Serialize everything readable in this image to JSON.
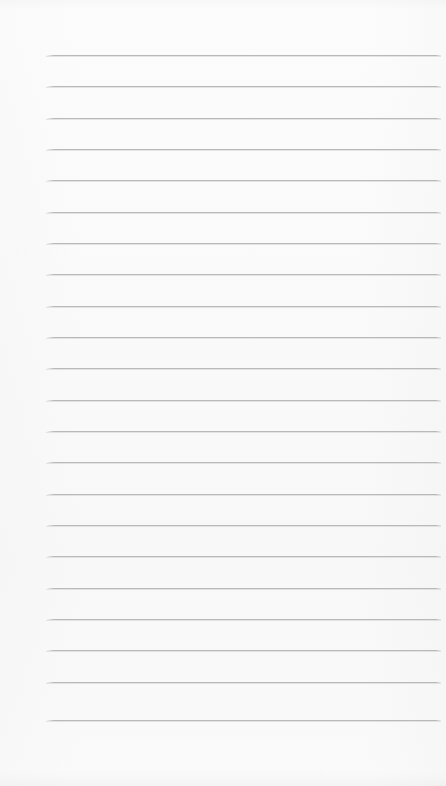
{
  "document": {
    "kind": "lined-paper",
    "title": "",
    "text_content": "",
    "page_width": 446,
    "page_height": 786,
    "background_color": "#fcfcfc"
  },
  "ruling": {
    "line_color": "#b9b9b9",
    "line_thickness": 1,
    "line_count": 22,
    "line_spacing": 31.3,
    "first_line_y": 55,
    "last_line_y": 720,
    "line_left_x": 46,
    "line_right_x": 441,
    "lines": [
      {
        "index": 1,
        "y": 55
      },
      {
        "index": 2,
        "y": 86
      },
      {
        "index": 3,
        "y": 118
      },
      {
        "index": 4,
        "y": 149
      },
      {
        "index": 5,
        "y": 180
      },
      {
        "index": 6,
        "y": 212
      },
      {
        "index": 7,
        "y": 243
      },
      {
        "index": 8,
        "y": 274
      },
      {
        "index": 9,
        "y": 306
      },
      {
        "index": 10,
        "y": 337
      },
      {
        "index": 11,
        "y": 368
      },
      {
        "index": 12,
        "y": 400
      },
      {
        "index": 13,
        "y": 431
      },
      {
        "index": 14,
        "y": 462
      },
      {
        "index": 15,
        "y": 494
      },
      {
        "index": 16,
        "y": 525
      },
      {
        "index": 17,
        "y": 556
      },
      {
        "index": 18,
        "y": 588
      },
      {
        "index": 19,
        "y": 619
      },
      {
        "index": 20,
        "y": 650
      },
      {
        "index": 21,
        "y": 682
      },
      {
        "index": 22,
        "y": 720
      }
    ]
  },
  "margins": {
    "top_blank_height": 55,
    "bottom_blank_height": 66,
    "left_margin_width": 46,
    "right_margin_width": 5,
    "has_vertical_margin_rule": false
  }
}
